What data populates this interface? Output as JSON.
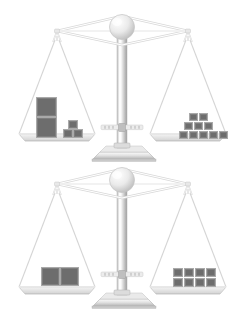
{
  "scene": {
    "title": "Two balance scales comparing large and small cube weights",
    "background_color": "#ffffff",
    "metal_light": "#f2f2f2",
    "metal_mid": "#d9d9d9",
    "metal_dark": "#9a9a9a",
    "string_color": "#cccccc",
    "block_fill": "#6d6d6d",
    "block_border": "#a9a9a9"
  },
  "balances": [
    {
      "id": "balance-top",
      "name": "top-balance",
      "state": "balanced",
      "left_pan": {
        "name": "top-left-pan",
        "large_blocks": 2,
        "small_blocks": 3,
        "arrangement": "two large cubes stacked vertically, three small cubes (one on top of two)"
      },
      "right_pan": {
        "name": "top-right-pan",
        "large_blocks": 0,
        "small_blocks": 10,
        "arrangement": "pyramid: 2 on top row, 3 on middle row, 5 on bottom row"
      }
    },
    {
      "id": "balance-bottom",
      "name": "bottom-balance",
      "state": "balanced",
      "left_pan": {
        "name": "bottom-left-pan",
        "large_blocks": 2,
        "small_blocks": 0,
        "arrangement": "two large cubes side by side"
      },
      "right_pan": {
        "name": "bottom-right-pan",
        "large_blocks": 0,
        "small_blocks": 8,
        "arrangement": "grid: 4 columns by 2 rows"
      }
    }
  ],
  "blocks": {
    "top_left": [
      {
        "x": 36,
        "y": 97,
        "w": 21,
        "h": 20,
        "size": "large"
      },
      {
        "x": 36,
        "y": 117,
        "w": 21,
        "h": 21,
        "size": "large"
      },
      {
        "x": 68,
        "y": 120,
        "w": 10,
        "h": 9,
        "size": "small"
      },
      {
        "x": 63,
        "y": 129,
        "w": 10,
        "h": 9,
        "size": "small"
      },
      {
        "x": 73,
        "y": 129,
        "w": 10,
        "h": 9,
        "size": "small"
      }
    ],
    "top_right": [
      {
        "x": 189,
        "y": 113,
        "w": 9,
        "h": 8,
        "size": "small"
      },
      {
        "x": 199,
        "y": 113,
        "w": 9,
        "h": 8,
        "size": "small"
      },
      {
        "x": 184,
        "y": 122,
        "w": 9,
        "h": 8,
        "size": "small"
      },
      {
        "x": 194,
        "y": 122,
        "w": 9,
        "h": 8,
        "size": "small"
      },
      {
        "x": 204,
        "y": 122,
        "w": 9,
        "h": 8,
        "size": "small"
      },
      {
        "x": 179,
        "y": 131,
        "w": 9,
        "h": 8,
        "size": "small"
      },
      {
        "x": 189,
        "y": 131,
        "w": 9,
        "h": 8,
        "size": "small"
      },
      {
        "x": 199,
        "y": 131,
        "w": 9,
        "h": 8,
        "size": "small"
      },
      {
        "x": 209,
        "y": 131,
        "w": 9,
        "h": 8,
        "size": "small"
      },
      {
        "x": 219,
        "y": 131,
        "w": 9,
        "h": 8,
        "size": "small"
      }
    ],
    "bottom_left": [
      {
        "x": 41,
        "y": 102,
        "w": 19,
        "h": 19,
        "size": "large"
      },
      {
        "x": 60,
        "y": 102,
        "w": 19,
        "h": 19,
        "size": "large"
      }
    ],
    "bottom_right": [
      {
        "x": 173,
        "y": 103,
        "w": 10,
        "h": 9,
        "size": "small"
      },
      {
        "x": 184,
        "y": 103,
        "w": 10,
        "h": 9,
        "size": "small"
      },
      {
        "x": 195,
        "y": 103,
        "w": 10,
        "h": 9,
        "size": "small"
      },
      {
        "x": 206,
        "y": 103,
        "w": 10,
        "h": 9,
        "size": "small"
      },
      {
        "x": 173,
        "y": 113,
        "w": 10,
        "h": 9,
        "size": "small"
      },
      {
        "x": 184,
        "y": 113,
        "w": 10,
        "h": 9,
        "size": "small"
      },
      {
        "x": 195,
        "y": 113,
        "w": 10,
        "h": 9,
        "size": "small"
      },
      {
        "x": 206,
        "y": 113,
        "w": 10,
        "h": 9,
        "size": "small"
      }
    ]
  }
}
